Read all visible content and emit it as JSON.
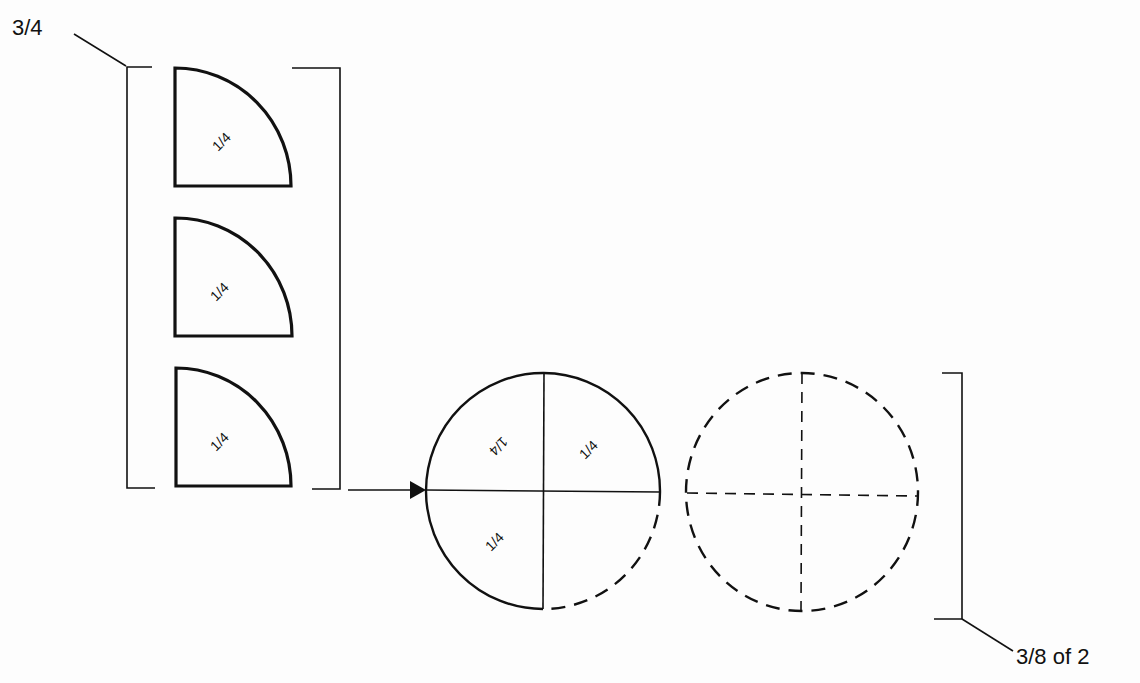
{
  "diagram": {
    "type": "fraction-illustration",
    "left_group": {
      "label": "3/4",
      "pieces": [
        {
          "label": "1/4"
        },
        {
          "label": "1/4"
        },
        {
          "label": "1/4"
        }
      ]
    },
    "arrow": {
      "direction": "right",
      "meaning": "pieces assembled into circle"
    },
    "circle_1": {
      "quadrants": [
        {
          "position": "top-left",
          "label": "1/4",
          "rotated": "upside-down",
          "filled": true
        },
        {
          "position": "top-right",
          "label": "1/4",
          "filled": true
        },
        {
          "position": "bottom-left",
          "label": "1/4",
          "filled": true
        },
        {
          "position": "bottom-right",
          "label": "",
          "filled": false,
          "outline": "dashed"
        }
      ]
    },
    "circle_2": {
      "outline": "dashed",
      "dividers": "dashed",
      "quadrants": [
        {
          "position": "top-left",
          "label": ""
        },
        {
          "position": "top-right",
          "label": ""
        },
        {
          "position": "bottom-left",
          "label": ""
        },
        {
          "position": "bottom-right",
          "label": ""
        }
      ]
    },
    "right_group": {
      "label": "3/8 of 2"
    },
    "colors": {
      "ink": "#111111",
      "paper": "#fdfdfd"
    }
  }
}
